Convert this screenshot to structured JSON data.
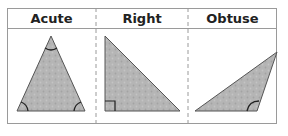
{
  "columns": [
    {
      "label": "Acute"
    },
    {
      "label": "Right"
    },
    {
      "label": "Obtuse"
    }
  ],
  "colors": {
    "fill": "#b5b5b5",
    "stroke": "#555555",
    "border": "#9a9a9a",
    "arc": "#222222"
  }
}
